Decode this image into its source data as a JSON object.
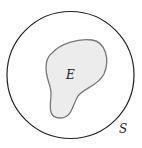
{
  "diagram": {
    "type": "venn-diagram",
    "sample_space": {
      "label": "S",
      "shape": "circle",
      "stroke": "#222222",
      "fill": "#ffffff"
    },
    "event": {
      "label": "E",
      "shape": "irregular-blob",
      "stroke": "#777777",
      "fill": "#ececec"
    }
  }
}
